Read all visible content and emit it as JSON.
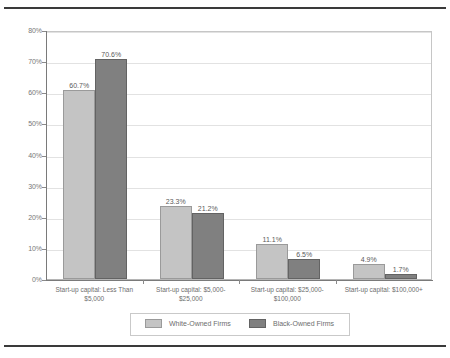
{
  "chart_data": {
    "type": "bar",
    "title": "",
    "subtitle": "",
    "xlabel": "",
    "ylabel": "",
    "ylim": [
      0,
      80
    ],
    "ytick_labels": [
      "0%",
      "10%",
      "20%",
      "30%",
      "40%",
      "50%",
      "60%",
      "70%",
      "80%"
    ],
    "ytick_values": [
      0,
      10,
      20,
      30,
      40,
      50,
      60,
      70,
      80
    ],
    "grid": true,
    "legend_position": "bottom",
    "categories": [
      "Start-up capital: Less Than $5,000",
      "Start-up capital: $5,000-$25,000",
      "Start-up capital: $25,000-$100,000",
      "Start-up capital: $100,000+"
    ],
    "category_lines": [
      [
        "Start-up capital: Less Than",
        "$5,000"
      ],
      [
        "Start-up capital: $5,000-",
        "$25,000"
      ],
      [
        "Start-up capital: $25,000-",
        "$100,000"
      ],
      [
        "Start-up capital: $100,000+",
        ""
      ]
    ],
    "series": [
      {
        "name": "White-Owned Firms",
        "color": "#c4c4c4",
        "values": [
          60.7,
          23.3,
          11.1,
          4.9
        ],
        "labels": [
          "60.7%",
          "23.3%",
          "11.1%",
          "4.9%"
        ]
      },
      {
        "name": "Black-Owned Firms",
        "color": "#808080",
        "values": [
          70.6,
          21.2,
          6.5,
          1.7
        ],
        "labels": [
          "70.6%",
          "21.2%",
          "6.5%",
          "1.7%"
        ]
      }
    ]
  },
  "legend": {
    "entries": [
      {
        "label": "White-Owned Firms"
      },
      {
        "label": "Black-Owned Firms"
      }
    ]
  }
}
